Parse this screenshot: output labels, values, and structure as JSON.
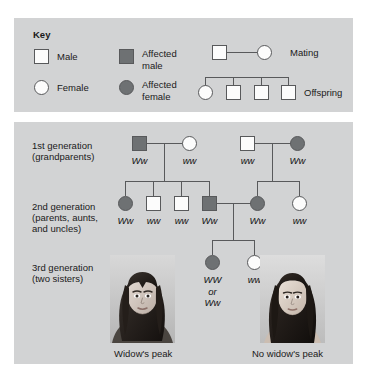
{
  "figure": {
    "type": "pedigree-chart",
    "trait": "Widow's peak",
    "background_panel_color": "#d2d3d4",
    "symbol_outline_color": "#58595b",
    "unaffected_fill": "#fcfcfc",
    "affected_fill": "#6e7173"
  },
  "key": {
    "title": "Key",
    "entries": [
      {
        "symbol": "square-unaffected",
        "label": "Male"
      },
      {
        "symbol": "square-affected",
        "label": "Affected\nmale"
      },
      {
        "symbol": "circle-unaffected",
        "label": "Female"
      },
      {
        "symbol": "circle-affected",
        "label": "Affected\nfemale"
      }
    ],
    "relationships": [
      {
        "symbol": "mating-line",
        "label": "Mating"
      },
      {
        "symbol": "offspring-line",
        "label": "Offspring"
      }
    ]
  },
  "generations": [
    {
      "id": "gen1",
      "label_line1": "1st generation",
      "label_line2": "(grandparents)",
      "individuals": [
        {
          "shape": "square",
          "affected": true,
          "genotype": "Ww"
        },
        {
          "shape": "circle",
          "affected": false,
          "genotype": "ww"
        },
        {
          "shape": "square",
          "affected": false,
          "genotype": "ww"
        },
        {
          "shape": "circle",
          "affected": true,
          "genotype": "Ww"
        }
      ]
    },
    {
      "id": "gen2",
      "label_line1": "2nd generation",
      "label_line2": "(parents, aunts,",
      "label_line3": "and uncles)",
      "individuals": [
        {
          "shape": "circle",
          "affected": true,
          "genotype": "Ww"
        },
        {
          "shape": "square",
          "affected": false,
          "genotype": "ww"
        },
        {
          "shape": "square",
          "affected": false,
          "genotype": "ww"
        },
        {
          "shape": "square",
          "affected": true,
          "genotype": "Ww"
        },
        {
          "shape": "circle",
          "affected": true,
          "genotype": "Ww"
        },
        {
          "shape": "circle",
          "affected": false,
          "genotype": "ww"
        }
      ]
    },
    {
      "id": "gen3",
      "label_line1": "3rd generation",
      "label_line2": "(two sisters)",
      "individuals": [
        {
          "shape": "circle",
          "affected": true,
          "genotype": "WW\nor\nWw"
        },
        {
          "shape": "circle",
          "affected": false,
          "genotype": "ww"
        }
      ]
    }
  ],
  "photos": [
    {
      "id": "photo-left",
      "caption": "Widow's peak",
      "description": "portrait-affected-sister"
    },
    {
      "id": "photo-right",
      "caption": "No widow's peak",
      "description": "portrait-unaffected-sister"
    }
  ]
}
